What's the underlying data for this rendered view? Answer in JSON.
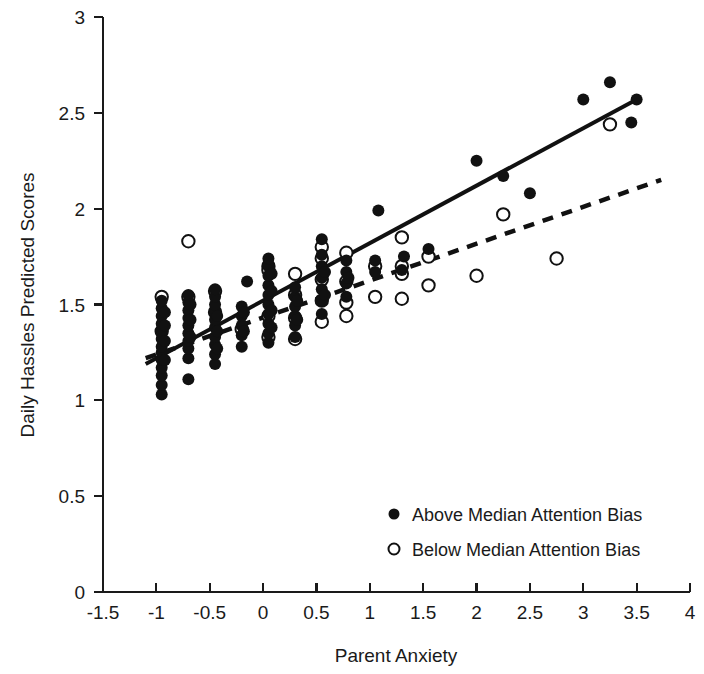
{
  "chart_data": {
    "type": "scatter",
    "title": "",
    "xlabel": "Parent Anxiety",
    "ylabel": "Daily Hassles Predicted Scores",
    "xlim": [
      -1.5,
      4
    ],
    "ylim": [
      0,
      3
    ],
    "xticks": [
      "-1.5",
      "-1",
      "-0.5",
      "0",
      "0.5",
      "1",
      "1.5",
      "2",
      "2.5",
      "3",
      "3.5",
      "4"
    ],
    "xtick_values": [
      -1.5,
      -1,
      -0.5,
      0,
      0.5,
      1,
      1.5,
      2,
      2.5,
      3,
      3.5,
      4
    ],
    "yticks": [
      "0",
      "0.5",
      "1",
      "1.5",
      "2",
      "2.5",
      "3"
    ],
    "ytick_values": [
      0,
      0.5,
      1,
      1.5,
      2,
      2.5,
      3
    ],
    "grid": false,
    "legend_position": "lower right",
    "legend": [
      {
        "marker": "filled-circle",
        "label": "Above Median Attention Bias"
      },
      {
        "marker": "open-circle",
        "label": "Below Median Attention Bias"
      }
    ],
    "series": [
      {
        "name": "Above Median Attention Bias",
        "marker": "filled-circle",
        "color": "#111111",
        "points": [
          [
            -0.95,
            1.03
          ],
          [
            -0.95,
            1.08
          ],
          [
            -0.95,
            1.13
          ],
          [
            -0.95,
            1.17
          ],
          [
            -0.95,
            1.21
          ],
          [
            -0.95,
            1.25
          ],
          [
            -0.95,
            1.28
          ],
          [
            -0.95,
            1.32
          ],
          [
            -0.95,
            1.36
          ],
          [
            -0.95,
            1.4
          ],
          [
            -0.95,
            1.44
          ],
          [
            -0.95,
            1.48
          ],
          [
            -0.95,
            1.52
          ],
          [
            -0.92,
            1.21
          ],
          [
            -0.92,
            1.31
          ],
          [
            -0.92,
            1.39
          ],
          [
            -0.92,
            1.46
          ],
          [
            -0.7,
            1.11
          ],
          [
            -0.7,
            1.22
          ],
          [
            -0.7,
            1.27
          ],
          [
            -0.7,
            1.31
          ],
          [
            -0.7,
            1.35
          ],
          [
            -0.7,
            1.39
          ],
          [
            -0.7,
            1.43
          ],
          [
            -0.7,
            1.47
          ],
          [
            -0.7,
            1.51
          ],
          [
            -0.7,
            1.55
          ],
          [
            -0.68,
            1.33
          ],
          [
            -0.68,
            1.42
          ],
          [
            -0.68,
            1.5
          ],
          [
            -0.45,
            1.19
          ],
          [
            -0.45,
            1.24
          ],
          [
            -0.45,
            1.29
          ],
          [
            -0.45,
            1.33
          ],
          [
            -0.45,
            1.38
          ],
          [
            -0.45,
            1.42
          ],
          [
            -0.45,
            1.46
          ],
          [
            -0.45,
            1.5
          ],
          [
            -0.45,
            1.54
          ],
          [
            -0.45,
            1.58
          ],
          [
            -0.43,
            1.27
          ],
          [
            -0.43,
            1.36
          ],
          [
            -0.43,
            1.44
          ],
          [
            -0.2,
            1.28
          ],
          [
            -0.2,
            1.34
          ],
          [
            -0.2,
            1.39
          ],
          [
            -0.2,
            1.44
          ],
          [
            -0.2,
            1.49
          ],
          [
            -0.18,
            1.36
          ],
          [
            -0.18,
            1.46
          ],
          [
            -0.15,
            1.62
          ],
          [
            0.05,
            1.3
          ],
          [
            0.05,
            1.35
          ],
          [
            0.05,
            1.4
          ],
          [
            0.05,
            1.45
          ],
          [
            0.05,
            1.5
          ],
          [
            0.05,
            1.55
          ],
          [
            0.05,
            1.6
          ],
          [
            0.05,
            1.65
          ],
          [
            0.05,
            1.7
          ],
          [
            0.05,
            1.74
          ],
          [
            0.08,
            1.38
          ],
          [
            0.08,
            1.47
          ],
          [
            0.08,
            1.57
          ],
          [
            0.08,
            1.66
          ],
          [
            0.3,
            1.33
          ],
          [
            0.3,
            1.39
          ],
          [
            0.3,
            1.44
          ],
          [
            0.3,
            1.49
          ],
          [
            0.3,
            1.54
          ],
          [
            0.3,
            1.59
          ],
          [
            0.32,
            1.42
          ],
          [
            0.32,
            1.52
          ],
          [
            0.55,
            1.45
          ],
          [
            0.55,
            1.52
          ],
          [
            0.55,
            1.58
          ],
          [
            0.55,
            1.64
          ],
          [
            0.55,
            1.7
          ],
          [
            0.55,
            1.76
          ],
          [
            0.55,
            1.84
          ],
          [
            0.58,
            1.55
          ],
          [
            0.58,
            1.67
          ],
          [
            0.78,
            1.54
          ],
          [
            0.78,
            1.61
          ],
          [
            0.78,
            1.67
          ],
          [
            0.78,
            1.73
          ],
          [
            0.8,
            1.64
          ],
          [
            1.05,
            1.67
          ],
          [
            1.05,
            1.73
          ],
          [
            1.08,
            1.99
          ],
          [
            1.3,
            1.68
          ],
          [
            1.32,
            1.75
          ],
          [
            1.55,
            1.79
          ],
          [
            2.0,
            2.25
          ],
          [
            2.25,
            2.17
          ],
          [
            2.5,
            2.08
          ],
          [
            3.0,
            2.57
          ],
          [
            3.25,
            2.66
          ],
          [
            3.45,
            2.45
          ],
          [
            3.5,
            2.57
          ]
        ]
      },
      {
        "name": "Below Median Attention Bias",
        "marker": "open-circle",
        "color": "#ffffff",
        "points": [
          [
            -0.95,
            1.36
          ],
          [
            -0.95,
            1.54
          ],
          [
            -0.7,
            1.83
          ],
          [
            -0.7,
            1.54
          ],
          [
            -0.45,
            1.57
          ],
          [
            -0.45,
            1.46
          ],
          [
            -0.2,
            1.37
          ],
          [
            0.05,
            1.7
          ],
          [
            0.05,
            1.68
          ],
          [
            0.05,
            1.44
          ],
          [
            0.05,
            1.33
          ],
          [
            0.3,
            1.66
          ],
          [
            0.3,
            1.55
          ],
          [
            0.3,
            1.43
          ],
          [
            0.3,
            1.32
          ],
          [
            0.55,
            1.8
          ],
          [
            0.55,
            1.74
          ],
          [
            0.55,
            1.63
          ],
          [
            0.55,
            1.52
          ],
          [
            0.55,
            1.41
          ],
          [
            0.78,
            1.77
          ],
          [
            0.78,
            1.62
          ],
          [
            0.78,
            1.51
          ],
          [
            0.78,
            1.44
          ],
          [
            1.05,
            1.7
          ],
          [
            1.05,
            1.54
          ],
          [
            1.3,
            1.85
          ],
          [
            1.3,
            1.7
          ],
          [
            1.3,
            1.66
          ],
          [
            1.3,
            1.53
          ],
          [
            1.55,
            1.75
          ],
          [
            1.55,
            1.6
          ],
          [
            2.0,
            1.65
          ],
          [
            2.25,
            1.97
          ],
          [
            2.75,
            1.74
          ],
          [
            3.25,
            2.44
          ]
        ]
      }
    ],
    "fit_lines": [
      {
        "name": "Above Median Attention Bias fit",
        "style": "solid",
        "color": "#111111",
        "x0": -1.1,
        "y0": 1.19,
        "x1": 3.5,
        "y1": 2.57
      },
      {
        "name": "Below Median Attention Bias fit",
        "style": "dashed",
        "color": "#111111",
        "x0": -1.1,
        "y0": 1.22,
        "x1": 3.73,
        "y1": 2.15
      }
    ]
  }
}
